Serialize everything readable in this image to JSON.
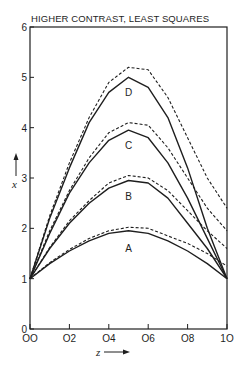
{
  "chart_data": {
    "type": "line",
    "title": "HIGHER CONTRAST, LEAST SQUARES",
    "xlabel": "z",
    "ylabel": "x",
    "xlim": [
      0.0,
      1.0
    ],
    "ylim": [
      0,
      6
    ],
    "grid": false,
    "x_ticks": [
      "0.0",
      "0.2",
      "0.4",
      "0.6",
      "0.8",
      "1.0"
    ],
    "x_tick_labels_display": [
      "OO",
      "O2",
      "O4",
      "O6",
      "O8",
      "1O"
    ],
    "y_ticks": [
      "0",
      "1",
      "2",
      "3",
      "4",
      "5",
      "6"
    ],
    "x": [
      0.0,
      0.1,
      0.2,
      0.3,
      0.4,
      0.5,
      0.6,
      0.7,
      0.8,
      0.9,
      1.0
    ],
    "legend": "curves labeled directly A, B, C, D; solid and dashed pairs",
    "series": [
      {
        "name": "D (solid)",
        "label": "D",
        "style": "solid",
        "values": [
          1.0,
          2.2,
          3.2,
          4.1,
          4.7,
          5.0,
          4.8,
          4.2,
          3.2,
          2.0,
          1.0
        ]
      },
      {
        "name": "D (dashed)",
        "label": "D",
        "style": "dashed",
        "values": [
          1.0,
          2.25,
          3.3,
          4.2,
          4.9,
          5.2,
          5.15,
          4.6,
          3.8,
          3.0,
          2.4
        ]
      },
      {
        "name": "C (solid)",
        "label": "C",
        "style": "solid",
        "values": [
          1.0,
          1.9,
          2.7,
          3.3,
          3.75,
          3.95,
          3.8,
          3.3,
          2.6,
          1.8,
          1.0
        ]
      },
      {
        "name": "C (dashed)",
        "label": "C",
        "style": "dashed",
        "values": [
          1.0,
          1.95,
          2.75,
          3.4,
          3.9,
          4.1,
          4.05,
          3.6,
          3.0,
          2.4,
          1.95
        ]
      },
      {
        "name": "B (solid)",
        "label": "B",
        "style": "solid",
        "values": [
          1.0,
          1.6,
          2.1,
          2.5,
          2.8,
          2.95,
          2.9,
          2.6,
          2.1,
          1.6,
          1.0
        ]
      },
      {
        "name": "B (dashed)",
        "label": "B",
        "style": "dashed",
        "values": [
          1.0,
          1.62,
          2.15,
          2.55,
          2.9,
          3.05,
          3.0,
          2.75,
          2.35,
          1.95,
          1.6
        ]
      },
      {
        "name": "A (solid)",
        "label": "A",
        "style": "solid",
        "values": [
          1.0,
          1.3,
          1.55,
          1.75,
          1.9,
          1.95,
          1.9,
          1.75,
          1.55,
          1.3,
          1.0
        ]
      },
      {
        "name": "A (dashed)",
        "label": "A",
        "style": "dashed",
        "values": [
          1.0,
          1.32,
          1.58,
          1.8,
          1.95,
          2.02,
          2.0,
          1.85,
          1.7,
          1.5,
          1.25
        ]
      }
    ],
    "curve_labels": [
      {
        "text": "D",
        "z": 0.5,
        "y": 4.7
      },
      {
        "text": "C",
        "z": 0.5,
        "y": 3.65
      },
      {
        "text": "B",
        "z": 0.5,
        "y": 2.65
      },
      {
        "text": "A",
        "z": 0.5,
        "y": 1.6
      }
    ],
    "colors": {
      "ink": "#1e1e1e",
      "background": "#ffffff"
    }
  }
}
